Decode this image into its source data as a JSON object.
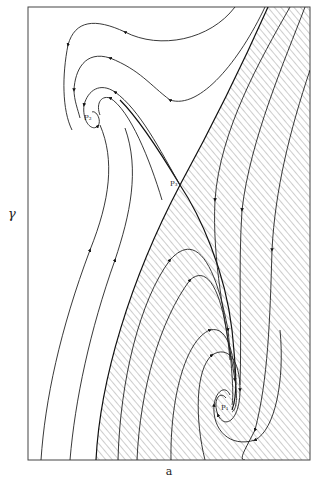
{
  "figure": {
    "type": "phase-portrait",
    "x_axis_label": "a",
    "y_axis_label": "γ",
    "points": [
      {
        "id": "P2",
        "label": "P₂",
        "kind": "spiral focus (upper-left)"
      },
      {
        "id": "P3",
        "label": "P₃",
        "kind": "saddle point"
      },
      {
        "id": "P1",
        "label": "P₁",
        "kind": "spiral focus (lower-right)"
      }
    ],
    "shaded_region": "basin of P1 (hatched)",
    "colors": {
      "ink": "#222222",
      "hatch": "#555555",
      "background": "#ffffff"
    }
  }
}
